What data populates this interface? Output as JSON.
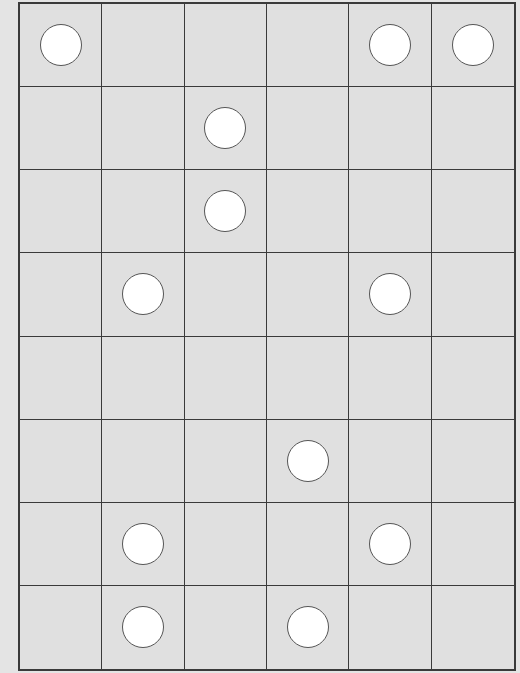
{
  "board": {
    "rows": 8,
    "cols": 6,
    "colors": {
      "background": "#e0e0e0",
      "line": "#3a3a3a",
      "piece_fill": "#ffffff",
      "piece_stroke": "#555555"
    },
    "pieces": [
      {
        "row": 0,
        "col": 0,
        "type": "white-circle"
      },
      {
        "row": 0,
        "col": 4,
        "type": "white-circle"
      },
      {
        "row": 0,
        "col": 5,
        "type": "white-circle"
      },
      {
        "row": 1,
        "col": 2,
        "type": "white-circle"
      },
      {
        "row": 2,
        "col": 2,
        "type": "white-circle"
      },
      {
        "row": 3,
        "col": 1,
        "type": "white-circle"
      },
      {
        "row": 3,
        "col": 4,
        "type": "white-circle"
      },
      {
        "row": 5,
        "col": 3,
        "type": "white-circle"
      },
      {
        "row": 6,
        "col": 1,
        "type": "white-circle"
      },
      {
        "row": 6,
        "col": 4,
        "type": "white-circle"
      },
      {
        "row": 7,
        "col": 1,
        "type": "white-circle"
      },
      {
        "row": 7,
        "col": 3,
        "type": "white-circle"
      }
    ]
  }
}
